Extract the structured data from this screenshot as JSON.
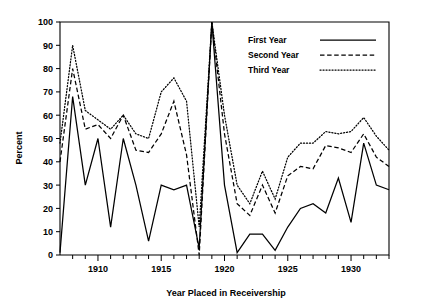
{
  "chart_data": {
    "type": "line",
    "title": "",
    "xlabel": "Year Placed in Receivership",
    "ylabel": "Percent",
    "xlim": [
      1907,
      1933
    ],
    "ylim": [
      0,
      100
    ],
    "grid": false,
    "legend_position": "top-right",
    "xticks_major": [
      1910,
      1915,
      1920,
      1925,
      1930
    ],
    "xticks_minor_step": 1,
    "yticks": [
      0,
      10,
      20,
      30,
      40,
      50,
      60,
      70,
      80,
      90,
      100
    ],
    "x": [
      1907,
      1908,
      1909,
      1910,
      1911,
      1912,
      1913,
      1914,
      1915,
      1916,
      1917,
      1918,
      1919,
      1920,
      1921,
      1922,
      1923,
      1924,
      1925,
      1926,
      1927,
      1928,
      1929,
      1930,
      1931,
      1932,
      1933
    ],
    "series": [
      {
        "name": "First Year",
        "style": "solid",
        "values": [
          1,
          68,
          30,
          50,
          12,
          50,
          30,
          6,
          30,
          28,
          30,
          3,
          100,
          30,
          1,
          9,
          9,
          2,
          12,
          20,
          22,
          18,
          33,
          14,
          48,
          30,
          28
        ]
      },
      {
        "name": "Second Year",
        "style": "dashed",
        "values": [
          40,
          80,
          54,
          56,
          50,
          60,
          45,
          44,
          52,
          66,
          43,
          0,
          100,
          52,
          22,
          17,
          30,
          18,
          34,
          38,
          37,
          47,
          46,
          44,
          52,
          42,
          38
        ]
      },
      {
        "name": "Third Year",
        "style": "dotted",
        "values": [
          48,
          90,
          62,
          58,
          54,
          60,
          52,
          50,
          70,
          76,
          66,
          12,
          100,
          60,
          30,
          22,
          36,
          24,
          42,
          48,
          48,
          53,
          52,
          53,
          59,
          51,
          45
        ]
      }
    ]
  },
  "legend": {
    "items": [
      {
        "label": "First Year",
        "style": "solid"
      },
      {
        "label": "Second Year",
        "style": "dashed"
      },
      {
        "label": "Third Year",
        "style": "dotted"
      }
    ]
  },
  "axis": {
    "x_tick_labels": [
      "1910",
      "1915",
      "1920",
      "1925",
      "1930"
    ],
    "y_tick_labels": [
      "0",
      "10",
      "20",
      "30",
      "40",
      "50",
      "60",
      "70",
      "80",
      "90",
      "100"
    ]
  }
}
